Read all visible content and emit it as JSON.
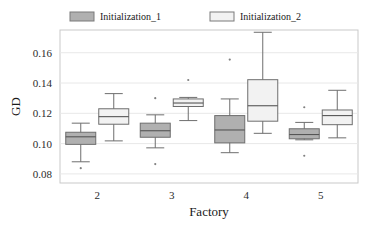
{
  "chart_data": {
    "type": "box",
    "title": "",
    "xlabel": "Factory",
    "ylabel": "GD",
    "categories": [
      "2",
      "3",
      "4",
      "5"
    ],
    "ylim": [
      0.074,
      0.175
    ],
    "yticks": [
      0.08,
      0.1,
      0.12,
      0.14,
      0.16
    ],
    "ytick_labels": [
      "0.08",
      "0.10",
      "0.12",
      "0.14",
      "0.16"
    ],
    "grid": true,
    "legend_position": "top",
    "series": [
      {
        "name": "Initialization_1",
        "color": "#b0b0b0",
        "edge": "#6e6e6e",
        "boxes": [
          {
            "category": "2",
            "whisker_low": 0.088,
            "q1": 0.0995,
            "median": 0.1045,
            "q3": 0.1075,
            "whisker_high": 0.1135,
            "outliers": [
              0.0838
            ]
          },
          {
            "category": "3",
            "whisker_low": 0.0972,
            "q1": 0.1042,
            "median": 0.1085,
            "q3": 0.1135,
            "whisker_high": 0.119,
            "outliers": [
              0.13,
              0.0865
            ]
          },
          {
            "category": "4",
            "whisker_low": 0.094,
            "q1": 0.1005,
            "median": 0.109,
            "q3": 0.1185,
            "whisker_high": 0.1295,
            "outliers": [
              0.1555
            ]
          },
          {
            "category": "5",
            "whisker_low": 0.1025,
            "q1": 0.1032,
            "median": 0.106,
            "q3": 0.1098,
            "whisker_high": 0.114,
            "outliers": [
              0.124,
              0.092
            ]
          }
        ]
      },
      {
        "name": "Initialization_2",
        "color": "#f2f2f2",
        "edge": "#6e6e6e",
        "boxes": [
          {
            "category": "2",
            "whisker_low": 0.1018,
            "q1": 0.1128,
            "median": 0.1178,
            "q3": 0.123,
            "whisker_high": 0.133,
            "outliers": []
          },
          {
            "category": "3",
            "whisker_low": 0.1152,
            "q1": 0.1245,
            "median": 0.1268,
            "q3": 0.1295,
            "whisker_high": 0.1305,
            "outliers": [
              0.142
            ]
          },
          {
            "category": "4",
            "whisker_low": 0.1068,
            "q1": 0.1148,
            "median": 0.125,
            "q3": 0.1422,
            "whisker_high": 0.1735,
            "outliers": []
          },
          {
            "category": "5",
            "whisker_low": 0.1038,
            "q1": 0.1125,
            "median": 0.1185,
            "q3": 0.1222,
            "whisker_high": 0.1352,
            "outliers": []
          }
        ]
      }
    ]
  },
  "legend": {
    "items": [
      {
        "label": "Initialization_1",
        "swatch": "#b0b0b0"
      },
      {
        "label": "Initialization_2",
        "swatch": "#f2f2f2"
      }
    ]
  },
  "axes": {
    "y_title": "GD",
    "x_title": "Factory"
  }
}
